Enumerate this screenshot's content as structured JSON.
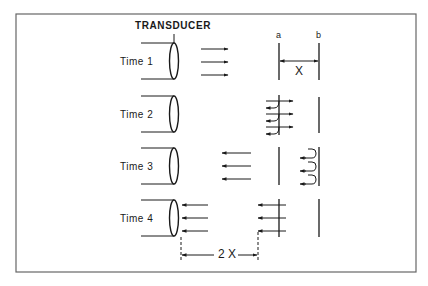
{
  "diagram": {
    "title": "TRANSDUCER",
    "rows": [
      {
        "label": "Time 1",
        "description": "Pulse travels from transducer toward interfaces a and b"
      },
      {
        "label": "Time 2",
        "description": "Pulse reaches interface a; part reflected back, part transmitted"
      },
      {
        "label": "Time 3",
        "description": "Reflection from a travels back; transmitted pulse reflects at b"
      },
      {
        "label": "Time 4",
        "description": "Echo from a reaches transducer; echo from b still 2X behind"
      }
    ],
    "interfaces": {
      "a_label": "a",
      "b_label": "b"
    },
    "distance_label": "X",
    "double_distance_label": "2 X",
    "colors": {
      "ink": "#1a1a1a",
      "border": "#555555",
      "background": "#ffffff"
    }
  }
}
